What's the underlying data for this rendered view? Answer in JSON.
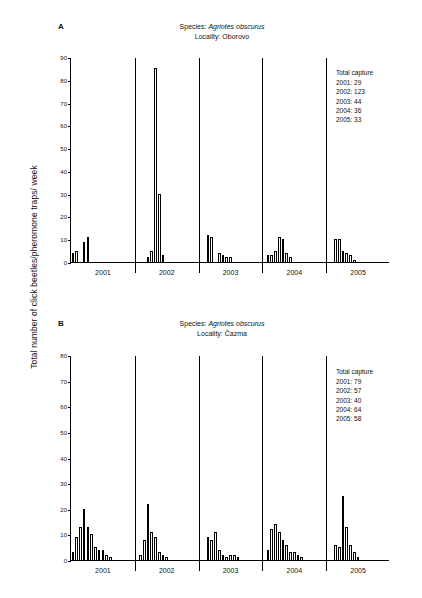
{
  "figure": {
    "ylabel": "Total number of click beetles/pheromone traps/ week"
  },
  "panels": [
    {
      "letter": "A",
      "species_prefix": "Species: ",
      "species": "Agriotes obscurus",
      "locality": "Locality: Oborovo",
      "legend_title": "Total capture",
      "legend_items": [
        "2001: 29",
        "2002: 123",
        "2003: 44",
        "2004: 36",
        "2005: 33"
      ],
      "chart_data": {
        "type": "bar",
        "title": "Species: Agriotes obscurus / Locality: Oborovo",
        "xlabel": "",
        "ylabel": "Total number of click beetles/pheromone traps/ week",
        "ylim": [
          0,
          90
        ],
        "yticks": [
          0,
          10,
          20,
          30,
          40,
          50,
          60,
          70,
          80,
          90
        ],
        "grid": false,
        "legend_position": "top-right",
        "categories": [
          "2001",
          "2002",
          "2003",
          "2004",
          "2005"
        ],
        "series": [
          {
            "name": "2001",
            "values": [
              4,
              5,
              0,
              9,
              11,
              0,
              0,
              0,
              0,
              0,
              0,
              0,
              0,
              0,
              0,
              0,
              0
            ]
          },
          {
            "name": "2002",
            "values": [
              0,
              0,
              0,
              2,
              5,
              85,
              30,
              3,
              0,
              0,
              0,
              0,
              0,
              0,
              0,
              0,
              0
            ]
          },
          {
            "name": "2003",
            "values": [
              0,
              0,
              12,
              11,
              0,
              4,
              3,
              2,
              2,
              0,
              0,
              0,
              0,
              0,
              0,
              0,
              0
            ]
          },
          {
            "name": "2004",
            "values": [
              0,
              3,
              3,
              5,
              11,
              10,
              4,
              2,
              0,
              0,
              0,
              0,
              0,
              0,
              0,
              0,
              0
            ]
          },
          {
            "name": "2005",
            "values": [
              0,
              0,
              10,
              10,
              5,
              4,
              3,
              1,
              0,
              0,
              0,
              0,
              0,
              0,
              0,
              0,
              0
            ]
          }
        ]
      }
    },
    {
      "letter": "B",
      "species_prefix": "Species: ",
      "species": "Agriotes obscurus",
      "locality": "Locality: Čazma",
      "legend_title": "Total capture",
      "legend_items": [
        "2001: 79",
        "2002: 57",
        "2003: 40",
        "2004: 64",
        "2005: 58"
      ],
      "chart_data": {
        "type": "bar",
        "title": "Species: Agriotes obscurus / Locality: Čazma",
        "xlabel": "",
        "ylabel": "Total number of click beetles/pheromone traps/ week",
        "ylim": [
          0,
          80
        ],
        "yticks": [
          0,
          10,
          20,
          30,
          40,
          50,
          60,
          70,
          80
        ],
        "grid": false,
        "legend_position": "top-right",
        "categories": [
          "2001",
          "2002",
          "2003",
          "2004",
          "2005"
        ],
        "series": [
          {
            "name": "2001",
            "values": [
              3,
              9,
              13,
              20,
              13,
              10,
              5,
              4,
              4,
              2,
              1,
              0,
              0,
              0,
              0,
              0,
              0
            ]
          },
          {
            "name": "2002",
            "values": [
              0,
              2,
              8,
              22,
              11,
              9,
              3,
              2,
              1,
              0,
              0,
              0,
              0,
              0,
              0,
              0,
              0
            ]
          },
          {
            "name": "2003",
            "values": [
              0,
              0,
              9,
              8,
              11,
              4,
              2,
              1,
              2,
              2,
              1,
              0,
              0,
              0,
              0,
              0,
              0
            ]
          },
          {
            "name": "2004",
            "values": [
              0,
              4,
              12,
              14,
              11,
              8,
              6,
              3,
              3,
              2,
              1,
              0,
              0,
              0,
              0,
              0,
              0
            ]
          },
          {
            "name": "2005",
            "values": [
              0,
              0,
              6,
              5,
              25,
              13,
              6,
              3,
              1,
              0,
              0,
              0,
              0,
              0,
              0,
              0,
              0
            ]
          }
        ]
      }
    }
  ]
}
